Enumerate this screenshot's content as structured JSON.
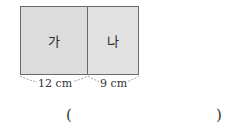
{
  "figure": {
    "part_a_label": "가",
    "part_b_label": "나",
    "part_a_width": "12 cm",
    "part_b_width": "9 cm"
  },
  "answer": {
    "open_paren": "(",
    "close_paren": ")",
    "value": ""
  },
  "colors": {
    "part_a_fill": "#dcdcdc",
    "part_b_fill": "#e2e2e2",
    "border": "#6a6a6a"
  }
}
